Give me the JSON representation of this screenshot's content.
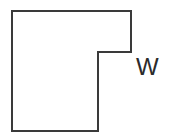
{
  "figure": {
    "kind": "geometry-diagram",
    "background_color": "#ffffff",
    "stroke_color": "#3a3a3a",
    "stroke_width": 2,
    "fill_color": "none",
    "viewbox": "0 0 177 139",
    "shape": {
      "name": "notched-rectangle",
      "points": "12,11 131,11 131,52 98,52 98,131 12,131",
      "vertices": [
        {
          "x": 12,
          "y": 11
        },
        {
          "x": 131,
          "y": 11
        },
        {
          "x": 131,
          "y": 52
        },
        {
          "x": 98,
          "y": 52
        },
        {
          "x": 98,
          "y": 131
        },
        {
          "x": 12,
          "y": 131
        }
      ]
    },
    "labels": [
      {
        "id": "w",
        "text": "W",
        "x": 136,
        "y": 55,
        "font_size": 24,
        "color": "#2b2b2b",
        "refers_to": "right-edge-segment"
      }
    ]
  }
}
